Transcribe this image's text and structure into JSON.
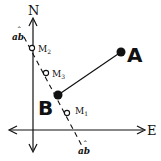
{
  "diagram": {
    "axes": {
      "north_label": "N",
      "east_label": "E"
    },
    "line_ab": {
      "label_top": "ab",
      "label_bottom": "ab",
      "accent_mark": "ˆ"
    },
    "points": {
      "A": {
        "label": "A",
        "x": 121,
        "y": 52,
        "filled": true
      },
      "B": {
        "label": "B",
        "x": 58,
        "y": 95,
        "filled": true
      },
      "M1": {
        "label": "M",
        "sub": "1",
        "x": 67,
        "y": 113,
        "filled": false
      },
      "M2": {
        "label": "M",
        "sub": "2",
        "x": 32,
        "y": 48,
        "filled": false
      },
      "M3": {
        "label": "M",
        "sub": "3",
        "x": 46,
        "y": 73,
        "filled": false
      }
    },
    "colors": {
      "stroke": "#111111",
      "background": "#ffffff"
    }
  }
}
